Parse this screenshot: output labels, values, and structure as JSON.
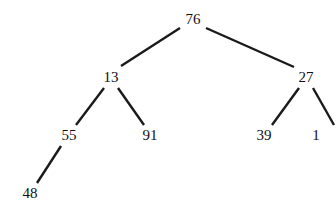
{
  "diagram": {
    "type": "binary-tree",
    "nodes": [
      {
        "id": "n76",
        "label": "76",
        "x": 193,
        "y": 19
      },
      {
        "id": "n13",
        "label": "13",
        "x": 111,
        "y": 77
      },
      {
        "id": "n27",
        "label": "27",
        "x": 306,
        "y": 77
      },
      {
        "id": "n55",
        "label": "55",
        "x": 69,
        "y": 135
      },
      {
        "id": "n91",
        "label": "91",
        "x": 150,
        "y": 135
      },
      {
        "id": "n39",
        "label": "39",
        "x": 264,
        "y": 135
      },
      {
        "id": "n1",
        "label": "1",
        "x": 316,
        "y": 135
      },
      {
        "id": "n48",
        "label": "48",
        "x": 30,
        "y": 193
      }
    ],
    "edges": [
      {
        "from": "n76",
        "to": "n13",
        "x1": 180,
        "y1": 28,
        "x2": 121,
        "y2": 66
      },
      {
        "from": "n76",
        "to": "n27",
        "x1": 206,
        "y1": 28,
        "x2": 294,
        "y2": 67
      },
      {
        "from": "n13",
        "to": "n55",
        "x1": 104,
        "y1": 88,
        "x2": 76,
        "y2": 125
      },
      {
        "from": "n13",
        "to": "n91",
        "x1": 118,
        "y1": 88,
        "x2": 144,
        "y2": 125
      },
      {
        "from": "n27",
        "to": "n39",
        "x1": 299,
        "y1": 88,
        "x2": 272,
        "y2": 125
      },
      {
        "from": "n27",
        "to": "n1",
        "x1": 313,
        "y1": 88,
        "x2": 334,
        "y2": 125
      },
      {
        "from": "n55",
        "to": "n48",
        "x1": 61,
        "y1": 146,
        "x2": 37,
        "y2": 183
      }
    ]
  }
}
